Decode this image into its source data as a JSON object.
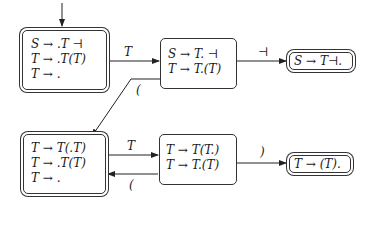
{
  "states": [
    {
      "id": "s0",
      "accepting": true,
      "start": true,
      "items": [
        "S → .T ⊣",
        "T → .T(T)",
        "T → ."
      ]
    },
    {
      "id": "s1",
      "accepting": false,
      "items": [
        "S → T. ⊣",
        "T → T.(T)"
      ]
    },
    {
      "id": "s2",
      "accepting": true,
      "items": [
        "S → T⊣."
      ]
    },
    {
      "id": "s3",
      "accepting": true,
      "items": [
        "T → T(.T)",
        "T → .T(T)",
        "T → ."
      ]
    },
    {
      "id": "s4",
      "accepting": false,
      "items": [
        "T → T(T.)",
        "T → T.(T)"
      ]
    },
    {
      "id": "s5",
      "accepting": true,
      "items": [
        "T → (T)."
      ]
    }
  ],
  "transitions": [
    {
      "from": "s0",
      "to": "s1",
      "label": "T"
    },
    {
      "from": "s1",
      "to": "s2",
      "label": "⊣"
    },
    {
      "from": "s1",
      "to": "s3",
      "label": "("
    },
    {
      "from": "s3",
      "to": "s4",
      "label": "T"
    },
    {
      "from": "s4",
      "to": "s3",
      "label": "("
    },
    {
      "from": "s4",
      "to": "s5",
      "label": ")"
    }
  ]
}
